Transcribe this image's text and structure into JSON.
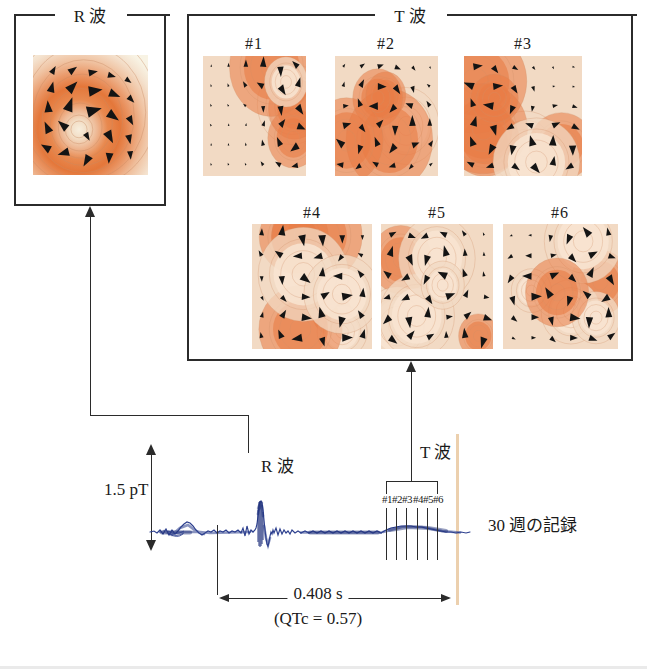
{
  "figure": {
    "caption_visible": ""
  },
  "groups": [
    {
      "id": "r-wave-group",
      "label": "R 波",
      "x": 14,
      "y": 16,
      "w": 152,
      "h": 190,
      "label_cx": 90,
      "gap_l": 55,
      "gap_r": 125
    },
    {
      "id": "t-wave-group",
      "label": "T 波",
      "x": 187,
      "y": 16,
      "w": 446,
      "h": 345,
      "label_cx": 410,
      "gap_l": 375,
      "gap_r": 445
    }
  ],
  "r_wave_panel": {
    "name": "R 波",
    "map": {
      "x": 33,
      "y": 55,
      "w": 115,
      "h": 120
    }
  },
  "t_wave_panels": [
    {
      "label": "#1",
      "x": 203,
      "y": 56,
      "w": 103,
      "h": 120,
      "label_cx": 254,
      "label_y": 36
    },
    {
      "label": "#2",
      "x": 335,
      "y": 56,
      "w": 103,
      "h": 120,
      "label_cx": 386,
      "label_y": 36
    },
    {
      "label": "#3",
      "x": 464,
      "y": 56,
      "w": 118,
      "h": 120,
      "label_cx": 523,
      "label_y": 36
    },
    {
      "label": "#4",
      "x": 252,
      "y": 224,
      "w": 120,
      "h": 125,
      "label_cx": 312,
      "label_y": 205
    },
    {
      "label": "#5",
      "x": 381,
      "y": 224,
      "w": 112,
      "h": 125,
      "label_cx": 437,
      "label_y": 205
    },
    {
      "label": "#6",
      "x": 503,
      "y": 224,
      "w": 115,
      "h": 125,
      "label_cx": 560,
      "label_y": 205
    }
  ],
  "ecg": {
    "amplitude_label": "1.5 pT",
    "r_wave_label": "R 波",
    "t_wave_label": "T 波",
    "record_label": "30 週の記録",
    "duration_label": "0.408 s",
    "qtc_label": "(QTc = 0.57)",
    "tick_labels": [
      "#1",
      "#2",
      "#3",
      "#4",
      "#5",
      "#6"
    ],
    "trace_color": "#2c3f8e",
    "time_rule_color": "#ecd0ae"
  },
  "chart_data": {
    "type": "line",
    "title": "",
    "xlabel": "",
    "ylabel": "",
    "series": [
      {
        "name": "fetal magnetocardiogram",
        "description": "30-week fetal MCG averaged trace with P, QRS (R wave) and T wave",
        "amplitude_scale_pT": 1.5,
        "qt_interval_s": 0.408,
        "qtc": 0.57
      }
    ],
    "annotations": [
      {
        "text": "R 波",
        "at": "R-wave peak"
      },
      {
        "text": "T 波",
        "at": "T-wave segment"
      },
      {
        "text": "#1 #2 #3 #4 #5 #6",
        "at": "T-wave sample instants"
      }
    ]
  },
  "colors": {
    "ink": "#2b2b2b",
    "trace": "#2c3f8e",
    "rule": "#ecd0ae",
    "map_hot": "#e8753c",
    "map_mid": "#eda076",
    "map_low": "#f3cdb0",
    "map_pale": "#f3e7d6",
    "map_bg": "#f7f2e4"
  }
}
